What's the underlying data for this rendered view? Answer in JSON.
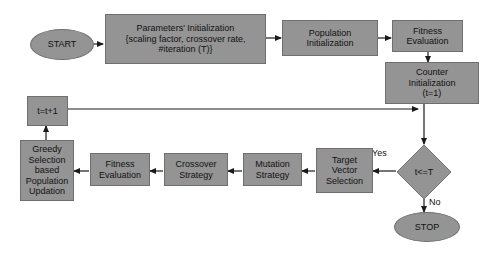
{
  "diagram": {
    "fill_color": "#949494",
    "stroke_color": "#6f6f6f",
    "line_color": "#1a1a1a",
    "background_color": "#ffffff",
    "nodes": [
      {
        "id": "start",
        "label": "START",
        "shape": "ellipse"
      },
      {
        "id": "params",
        "label": "Parameters' Initialization\n{scaling factor, crossover rate,\n#iteration (T)}",
        "shape": "rect"
      },
      {
        "id": "popinit",
        "label": "Population\nInitialization",
        "shape": "rect"
      },
      {
        "id": "fiteval1",
        "label": "Fitness\nEvaluation",
        "shape": "rect"
      },
      {
        "id": "counter",
        "label": "Counter\nInitialization\n(t=1)",
        "shape": "rect"
      },
      {
        "id": "decision",
        "label": "t<=T",
        "shape": "diamond"
      },
      {
        "id": "stop",
        "label": "STOP",
        "shape": "ellipse"
      },
      {
        "id": "target",
        "label": "Target\nVector\nSelection",
        "shape": "rect"
      },
      {
        "id": "mutation",
        "label": "Mutation\nStrategy",
        "shape": "rect"
      },
      {
        "id": "crossover",
        "label": "Crossover\nStrategy",
        "shape": "rect"
      },
      {
        "id": "fiteval2",
        "label": "Fitness\nEvaluation",
        "shape": "rect"
      },
      {
        "id": "greedy",
        "label": "Greedy\nSelection\nbased\nPopulation\nUpdation",
        "shape": "rect"
      },
      {
        "id": "counterinc",
        "label": "t=t+1",
        "shape": "rect"
      }
    ],
    "edge_labels": {
      "yes": "Yes",
      "no": "No"
    }
  }
}
